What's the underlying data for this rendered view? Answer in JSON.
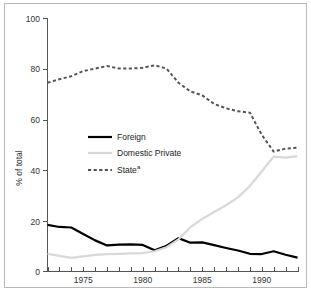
{
  "chart_data": {
    "type": "line",
    "title": "",
    "xlabel": "",
    "ylabel": "% of total",
    "xlim": [
      1972,
      1993
    ],
    "ylim": [
      0,
      100
    ],
    "grid": false,
    "legend_position": "center-left",
    "x": [
      1972,
      1973,
      1974,
      1975,
      1976,
      1977,
      1978,
      1979,
      1980,
      1981,
      1982,
      1983,
      1984,
      1985,
      1986,
      1987,
      1988,
      1989,
      1990,
      1991,
      1992,
      1993
    ],
    "y_ticks": [
      0,
      20,
      40,
      60,
      80,
      100
    ],
    "y_tick_labels": [
      "0",
      "20",
      "40",
      "60",
      "80",
      "100"
    ],
    "x_tick_labels": [
      "1975",
      "1980",
      "1985",
      "1990"
    ],
    "x_tick_label_years": [
      1975,
      1980,
      1985,
      1990
    ],
    "series": [
      {
        "name": "Foreign",
        "style": "solid",
        "color": "#000000",
        "width": 2.2,
        "values": [
          18.4,
          17.6,
          17.4,
          14.8,
          12.3,
          10.3,
          10.6,
          10.7,
          10.5,
          8.4,
          10.2,
          13.2,
          11.4,
          11.5,
          10.4,
          9.3,
          8.3,
          7.0,
          6.9,
          8.0,
          6.6,
          5.5
        ]
      },
      {
        "name": "Domestic Private",
        "style": "solid",
        "color": "#d8d8d8",
        "width": 2.2,
        "values": [
          7.0,
          6.2,
          5.4,
          6.0,
          6.6,
          6.9,
          7.0,
          7.2,
          7.3,
          8.0,
          9.6,
          12.7,
          17.5,
          20.8,
          23.5,
          26.2,
          29.3,
          33.8,
          39.6,
          45.4,
          45.0,
          45.6
        ]
      },
      {
        "name": "State",
        "legend_superscript": "a",
        "style": "dashed",
        "color": "#555555",
        "width": 2.0,
        "values": [
          74.6,
          76.0,
          77.2,
          79.2,
          80.2,
          81.2,
          80.2,
          80.2,
          80.5,
          81.5,
          80.2,
          74.6,
          71.2,
          69.6,
          66.2,
          64.5,
          63.3,
          62.8,
          54.0,
          47.4,
          48.6,
          48.9
        ]
      }
    ],
    "legend": [
      {
        "label": "Foreign",
        "superscript": ""
      },
      {
        "label": "Domestic Private",
        "superscript": ""
      },
      {
        "label": "State",
        "superscript": "a"
      }
    ]
  },
  "colors": {
    "foreign": "#000000",
    "domestic_private": "#d8d8d8",
    "state": "#555555",
    "axis": "#555555",
    "frame": "#b9b9b9",
    "text": "#333333"
  }
}
